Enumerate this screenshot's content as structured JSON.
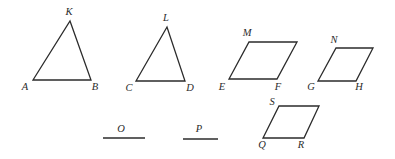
{
  "figure": {
    "width": 395,
    "height": 159,
    "stroke_color": "#2b2b2b",
    "background": "#ffffff",
    "shapes": [
      {
        "name": "triangle-abk",
        "type": "triangle",
        "points": "33,80 91,80 70,21",
        "labels": [
          {
            "text": "A",
            "x": 25,
            "y": 88
          },
          {
            "text": "B",
            "x": 95,
            "y": 88
          },
          {
            "text": "K",
            "x": 69,
            "y": 13
          }
        ]
      },
      {
        "name": "triangle-cdl",
        "type": "triangle",
        "points": "136,81 185,81 167,27",
        "labels": [
          {
            "text": "C",
            "x": 129,
            "y": 89
          },
          {
            "text": "D",
            "x": 190,
            "y": 89
          },
          {
            "text": "L",
            "x": 166,
            "y": 19
          }
        ]
      },
      {
        "name": "parallelogram-efm",
        "type": "parallelogram",
        "points": "229,79 277,79 297,42 249,42",
        "labels": [
          {
            "text": "E",
            "x": 222,
            "y": 88
          },
          {
            "text": "F",
            "x": 278,
            "y": 88
          },
          {
            "text": "M",
            "x": 247,
            "y": 34
          }
        ]
      },
      {
        "name": "parallelogram-ghn",
        "type": "parallelogram",
        "points": "318,81 356,81 373,48 336,48",
        "labels": [
          {
            "text": "G",
            "x": 311,
            "y": 88
          },
          {
            "text": "H",
            "x": 359,
            "y": 88
          },
          {
            "text": "N",
            "x": 334,
            "y": 41
          }
        ]
      },
      {
        "name": "parallelogram-qrs",
        "type": "parallelogram",
        "points": "263,138 304,138 319,106 279,106",
        "labels": [
          {
            "text": "S",
            "x": 272,
            "y": 103
          },
          {
            "text": "Q",
            "x": 262,
            "y": 146
          },
          {
            "text": "R",
            "x": 301,
            "y": 146
          }
        ]
      }
    ],
    "segments": [
      {
        "name": "segment-o",
        "x1": 103,
        "y1": 138,
        "x2": 145,
        "y2": 138,
        "label": {
          "text": "O",
          "x": 121,
          "y": 130
        }
      },
      {
        "name": "segment-p",
        "x1": 183,
        "y1": 139,
        "x2": 218,
        "y2": 139,
        "label": {
          "text": "P",
          "x": 199,
          "y": 130
        }
      }
    ]
  }
}
